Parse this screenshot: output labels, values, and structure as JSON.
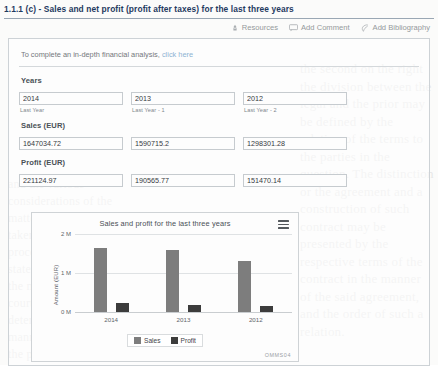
{
  "question": {
    "title": "1.1.1 (c) - Sales and net profit (profit after taxes) for the last three years"
  },
  "toolbar": {
    "resources_label": "Resources",
    "add_comment_label": "Add Comment",
    "add_bibliography_label": "Add Bibliography"
  },
  "hint": {
    "text": "To complete an in-depth financial analysis,",
    "link_label": "click here",
    "link_color": "#7aa7cc"
  },
  "form": {
    "years": {
      "label": "Years",
      "fields": [
        {
          "value": "2014",
          "sub": "Last Year"
        },
        {
          "value": "2013",
          "sub": "Last Year - 1"
        },
        {
          "value": "2012",
          "sub": "Last Year - 2"
        }
      ]
    },
    "sales": {
      "label": "Sales (EUR)",
      "fields": [
        {
          "value": "1647034.72"
        },
        {
          "value": "1590715.2"
        },
        {
          "value": "1298301.28"
        }
      ]
    },
    "profit": {
      "label": "Profit (EUR)",
      "fields": [
        {
          "value": "221124.97"
        },
        {
          "value": "190565.77"
        },
        {
          "value": "151470.14"
        }
      ]
    }
  },
  "chart_data": {
    "type": "bar",
    "title": "Sales and profit for the last three years",
    "xlabel": "",
    "ylabel": "Amount (EUR)",
    "categories": [
      "2014",
      "2013",
      "2012"
    ],
    "series": [
      {
        "name": "Sales",
        "values": [
          1647034.72,
          1590715.2,
          1298301.28
        ],
        "color": "#7d7d7d"
      },
      {
        "name": "Profit",
        "values": [
          221124.97,
          190565.77,
          151470.14
        ],
        "color": "#3c3c3c"
      }
    ],
    "ylim": [
      0,
      2000000
    ],
    "yticks": [
      "0 M",
      "1 M",
      "2 M"
    ],
    "ytick_values": [
      0,
      1000000,
      2000000
    ],
    "grid": true,
    "legend_position": "bottom",
    "menu_icon": "hamburger-menu-icon",
    "watermark": "OMMS04"
  },
  "bleed_text": {
    "right": "the second on the right the division between the legal and the prior may be defined by the relation of the terms to the parties in the question. The distinction or the agreement and a construction of such contract may be presented by the respective terms of the contract in the manner of the said agreement, and the order of such a relation.",
    "left": "and the various considerations of the matter which are to be taken into account in the proceeding and in the statement of the whole of the matter before the court for its determination in a manner consistent with the principles."
  }
}
